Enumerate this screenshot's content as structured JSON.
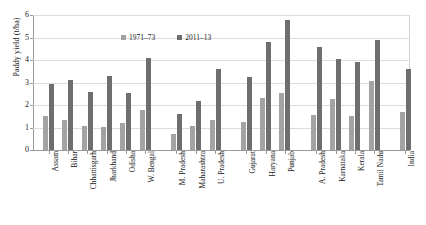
{
  "chart_data": {
    "type": "bar",
    "title": "",
    "xlabel": "",
    "ylabel": "Paddy yield (t/ha)",
    "ylim": [
      0,
      6
    ],
    "yticks": [
      0,
      1,
      2,
      3,
      4,
      5,
      6
    ],
    "grid": true,
    "legend_position": "top-center",
    "categories": [
      "Assam",
      "Bihar",
      "Chhattisgarh",
      "Jharkhand",
      "Odisha",
      "W. Bengal",
      "M. Pradesh",
      "Maharashtra",
      "U. Pradesh",
      "Gujarat",
      "Haryana",
      "Punjab",
      "A. Pradesh",
      "Karnataka",
      "Kerala",
      "Tamil Nadu",
      "India"
    ],
    "group_breaks_after": [
      "W. Bengal",
      "U. Pradesh",
      "Punjab",
      "Tamil Nadu"
    ],
    "series": [
      {
        "name": "1971–73",
        "color": "#a3a3a3",
        "values": [
          1.52,
          1.35,
          1.05,
          1.02,
          1.2,
          1.8,
          0.7,
          1.05,
          1.35,
          1.25,
          2.3,
          2.55,
          1.55,
          2.25,
          1.5,
          3.05,
          1.7
        ]
      },
      {
        "name": "2011–13",
        "color": "#6e6e6e",
        "values": [
          2.92,
          3.12,
          2.58,
          3.28,
          2.52,
          4.1,
          1.62,
          2.18,
          3.62,
          3.25,
          4.78,
          5.8,
          4.58,
          4.05,
          3.92,
          4.88,
          3.62
        ]
      }
    ]
  },
  "legend": {
    "items": [
      {
        "label": "1971–73",
        "color": "#a3a3a3"
      },
      {
        "label": "2011–13",
        "color": "#6e6e6e"
      }
    ]
  },
  "axes": {
    "y_title": "Paddy yield (t/ha)",
    "y_tick_labels": [
      "0",
      "1",
      "2",
      "3",
      "4",
      "5",
      "6"
    ]
  },
  "colors": {
    "series_1971": "#a3a3a3",
    "series_2011": "#6e6e6e",
    "axis": "#9a9a9a",
    "grid": "#dcdcdc",
    "text": "#1a1a1a",
    "background": "#ffffff"
  }
}
